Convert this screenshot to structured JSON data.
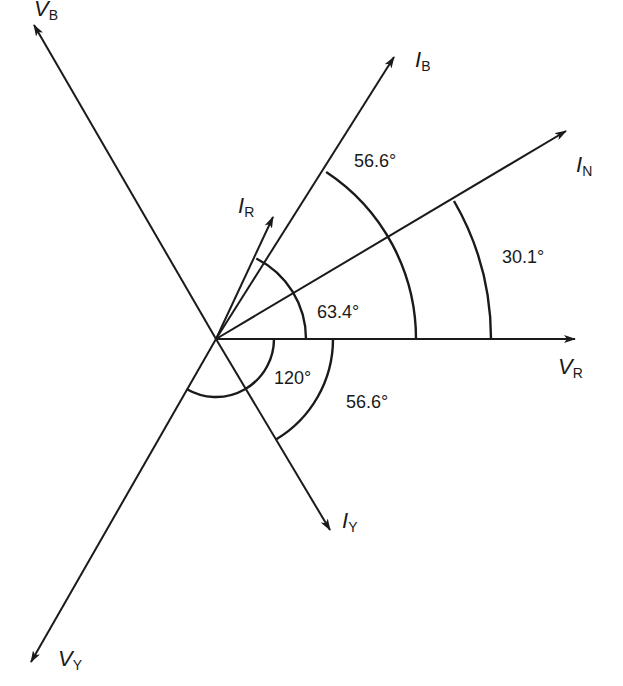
{
  "colors": {
    "line": "#1a1a1a",
    "background": "#ffffff"
  },
  "origin": {
    "x": 216,
    "y": 339
  },
  "phasors": [
    {
      "id": "VR",
      "symbol": "V",
      "subscript": "R",
      "tip": [
        575,
        339
      ],
      "label_pos": [
        558,
        372
      ]
    },
    {
      "id": "IN",
      "symbol": "I",
      "subscript": "N",
      "tip": [
        566,
        131
      ],
      "label_pos": [
        576,
        172
      ]
    },
    {
      "id": "IB",
      "symbol": "I",
      "subscript": "B",
      "tip": [
        394,
        57
      ],
      "label_pos": [
        415,
        67
      ]
    },
    {
      "id": "IR",
      "symbol": "I",
      "subscript": "R",
      "tip": [
        273,
        217
      ],
      "label_pos": [
        238,
        212
      ]
    },
    {
      "id": "VB",
      "symbol": "V",
      "subscript": "B",
      "tip": [
        34,
        25
      ],
      "label_pos": [
        63,
        37
      ]
    },
    {
      "id": "VY",
      "symbol": "V",
      "subscript": "Y",
      "tip": [
        31,
        662
      ],
      "label_pos": [
        58,
        665
      ]
    },
    {
      "id": "IY",
      "symbol": "I",
      "subscript": "Y",
      "tip": [
        330,
        530
      ],
      "label_pos": [
        342,
        528
      ]
    }
  ],
  "angles": [
    {
      "label": "63.4°",
      "between": [
        "VR",
        "IR"
      ],
      "radius": 90,
      "pos": [
        330,
        318
      ]
    },
    {
      "label": "56.6°",
      "between": [
        "VR",
        "IB"
      ],
      "radius": 200,
      "pos": [
        354,
        168
      ]
    },
    {
      "label": "30.1°",
      "between": [
        "VR",
        "IN"
      ],
      "radius": 275,
      "pos": [
        502,
        264
      ]
    },
    {
      "label": "120°",
      "between": [
        "VR",
        "VY"
      ],
      "radius": 58,
      "pos": [
        275,
        384
      ]
    },
    {
      "label": "56.6°",
      "between": [
        "VR",
        "IY"
      ],
      "radius": 117,
      "pos": [
        346,
        410
      ]
    }
  ],
  "labels": {
    "VR": {
      "main": "V",
      "sub": "R"
    },
    "IN": {
      "main": "I",
      "sub": "N"
    },
    "IB": {
      "main": "I",
      "sub": "B"
    },
    "IR": {
      "main": "I",
      "sub": "R"
    },
    "VB": {
      "main": "V",
      "sub": "B"
    },
    "VY": {
      "main": "V",
      "sub": "Y"
    },
    "IY": {
      "main": "I",
      "sub": "Y"
    },
    "ang_63_4": "63.4°",
    "ang_56_6_upper": "56.6°",
    "ang_30_1": "30.1°",
    "ang_120": "120°",
    "ang_56_6_lower": "56.6°"
  }
}
